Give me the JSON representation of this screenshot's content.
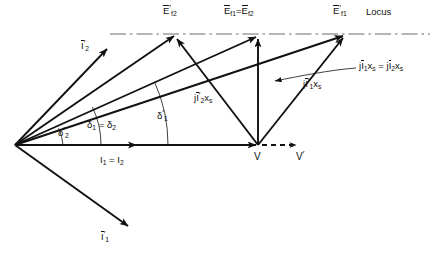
{
  "figure": {
    "type": "phasor-diagram",
    "background": "#ffffff",
    "stroke_color": "#111111",
    "locus_color": "#555555",
    "width": 432,
    "height": 254
  },
  "labels": {
    "ef2_prime": {
      "base": "E",
      "prime": "′",
      "sub": "f2",
      "overbar": true,
      "text": "Ē′f2"
    },
    "ef1_eq_ef2": {
      "text": "Ēf1 = Ēf2",
      "left_base": "E",
      "left_sub": "f1",
      "eq": "=",
      "right_base": "E",
      "right_sub": "f2"
    },
    "ef1_prime": {
      "base": "E",
      "prime": "′",
      "sub": "f1",
      "overbar": true,
      "text": "Ē′f1"
    },
    "locus": {
      "text": "Locus"
    },
    "i2_prime": {
      "base": "I",
      "prime": "′",
      "sub": "2",
      "overbar": true,
      "text": "Ī′2"
    },
    "i1_prime": {
      "base": "I",
      "prime": "′",
      "sub": "1",
      "overbar": true,
      "text": "Ī′1"
    },
    "jix_s_equal": {
      "text": "jĪ1xs = jĪ2xs",
      "l_j": "j",
      "l_base": "I",
      "l_sub": "1",
      "l_x": "x",
      "l_xsub": "s",
      "eq": "=",
      "r_j": "j",
      "r_base": "I",
      "r_sub": "2",
      "r_x": "x",
      "r_xsub": "s"
    },
    "ji1p_xs": {
      "text": "jĪ′1xs",
      "j": "j",
      "base": "I",
      "prime": "′",
      "sub": "1",
      "x": "x",
      "xsub": "s"
    },
    "ji2p_xs": {
      "text": "jĪ′2xs",
      "j": "j",
      "base": "I",
      "prime": "′",
      "sub": "2",
      "x": "x",
      "xsub": "s"
    },
    "delta2_prime": {
      "base": "δ",
      "prime": "′",
      "sub": "2",
      "text": "δ′2"
    },
    "delta1_eq_delta2": {
      "text": "δ1 = δ2",
      "left_base": "δ",
      "left_sub": "1",
      "eq": "=",
      "right_base": "δ",
      "right_sub": "2"
    },
    "delta1_prime": {
      "base": "δ",
      "prime": "′",
      "sub": "1",
      "text": "δ′1"
    },
    "i1_eq_i2": {
      "text": "I1 = I2",
      "left_base": "I",
      "left_sub": "1",
      "eq": "=",
      "right_base": "I",
      "right_sub": "2"
    },
    "v": {
      "text": "V"
    },
    "v_prime": {
      "base": "V",
      "prime": "′",
      "text": "V′"
    }
  },
  "geometry": {
    "origin": {
      "x": 15,
      "y": 145
    },
    "terminal_v": {
      "x": 258,
      "y": 145
    },
    "locus_y": 34,
    "locus_x_start": 110,
    "locus_x_end": 430,
    "points": {
      "ef2_prime_tip": {
        "x": 176,
        "y": 35
      },
      "ef1_tip": {
        "x": 258,
        "y": 35
      },
      "ef1_prime_tip": {
        "x": 345,
        "y": 34
      },
      "i2_prime_tip": {
        "x": 108,
        "y": 47
      },
      "i1_prime_tip": {
        "x": 130,
        "y": 228
      },
      "v_prime_tip": {
        "x": 300,
        "y": 145
      },
      "current_axis_tip": {
        "x": 258,
        "y": 145
      }
    },
    "angles_deg": {
      "delta2_prime": 19.5,
      "delta1_eq_delta2": 24.5,
      "delta1_prime": 24.4
    }
  }
}
